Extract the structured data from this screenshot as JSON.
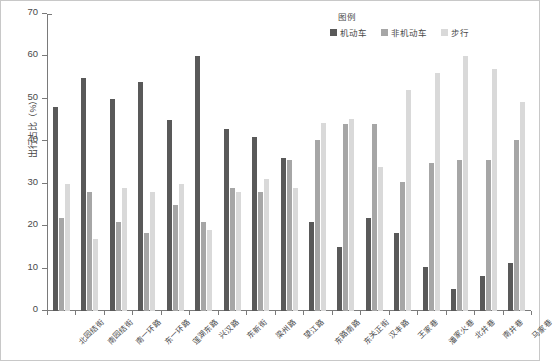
{
  "chart_data": {
    "type": "bar",
    "title": "",
    "xlabel": "",
    "ylabel": "出行占比（%）",
    "ylim": [
      0,
      70
    ],
    "ytick_step": 10,
    "yticks": [
      0,
      10,
      20,
      30,
      40,
      50,
      60,
      70
    ],
    "grid": false,
    "legend_title": "图例",
    "legend_position": "top-right",
    "categories": [
      "北园结街",
      "南园结街",
      "南一环路",
      "东一环路",
      "莲湖东路",
      "兴汉路",
      "东新街",
      "梁州路",
      "望江路",
      "东路南路",
      "东关正街",
      "汉丰路",
      "王家巷",
      "潘家火巷",
      "北井巷",
      "南井巷",
      "马家巷"
    ],
    "series": [
      {
        "name": "机动车",
        "color": "#595959",
        "values": [
          48,
          55,
          50,
          54,
          45,
          60,
          43,
          41,
          36,
          21,
          15,
          22,
          18.3,
          10.3,
          5.2,
          8.2,
          11.2
        ]
      },
      {
        "name": "非机动车",
        "color": "#a6a6a6",
        "values": [
          22,
          28,
          21,
          18.3,
          25,
          21,
          29,
          28,
          35.5,
          40.3,
          44,
          44,
          30.3,
          35,
          35.5,
          35.5,
          40.3
        ]
      },
      {
        "name": "步行",
        "color": "#d9d9d9",
        "values": [
          30,
          17,
          29,
          28,
          30,
          19,
          28,
          31,
          29,
          44.3,
          45.3,
          34,
          52,
          56,
          60,
          57,
          49.3
        ]
      }
    ]
  },
  "legend": {
    "title": "图例",
    "items": [
      {
        "label": "机动车",
        "color": "#595959"
      },
      {
        "label": "非机动车",
        "color": "#a6a6a6"
      },
      {
        "label": "步行",
        "color": "#d9d9d9"
      }
    ]
  },
  "axes": {
    "y_title": "出行占比（%）",
    "y_tick_labels": [
      "0",
      "10",
      "20",
      "30",
      "40",
      "50",
      "60",
      "70"
    ]
  }
}
